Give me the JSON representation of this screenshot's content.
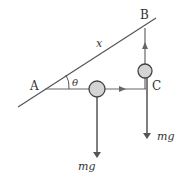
{
  "diagram": {
    "labels": {
      "point_a": "A",
      "point_b": "B",
      "point_c": "C",
      "length": "x",
      "angle": "θ",
      "weight_1": "mg",
      "weight_2": "mg"
    },
    "colors": {
      "line": "#555555",
      "ball_fill": "#d4d4d4",
      "ball_stroke": "#444444",
      "arrow": "#555555"
    }
  }
}
